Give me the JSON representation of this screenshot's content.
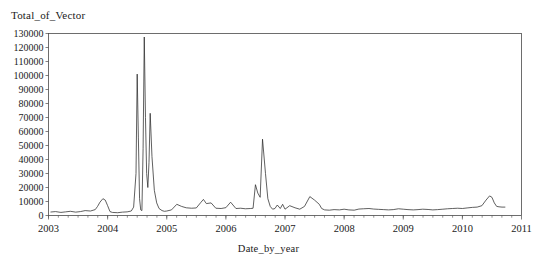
{
  "chart_data": {
    "type": "line",
    "title": "",
    "ylabel": "Total_of_Vector",
    "xlabel": "Date_by_year",
    "grid": false,
    "legend": null,
    "xlim": [
      2003.0,
      2011.0
    ],
    "ylim": [
      0,
      130000
    ],
    "x_tick_labels": [
      "2003",
      "2004",
      "2005",
      "2006",
      "2007",
      "2008",
      "2009",
      "2010",
      "2011"
    ],
    "x_tick_values": [
      2003,
      2004,
      2005,
      2006,
      2007,
      2008,
      2009,
      2010,
      2011
    ],
    "x_minor_tick_interval": 0.1667,
    "y_tick_labels": [
      "0",
      "10000",
      "20000",
      "30000",
      "40000",
      "50000",
      "60000",
      "70000",
      "80000",
      "90000",
      "100000",
      "110000",
      "120000",
      "130000"
    ],
    "y_tick_values": [
      0,
      10000,
      20000,
      30000,
      40000,
      50000,
      60000,
      70000,
      80000,
      90000,
      100000,
      110000,
      120000,
      130000
    ],
    "series": [
      {
        "name": "Total_of_Vector",
        "x": [
          2003.04,
          2003.12,
          2003.21,
          2003.29,
          2003.37,
          2003.46,
          2003.54,
          2003.62,
          2003.71,
          2003.79,
          2003.83,
          2003.87,
          2003.92,
          2003.96,
          2004.0,
          2004.04,
          2004.08,
          2004.17,
          2004.25,
          2004.33,
          2004.4,
          2004.44,
          2004.48,
          2004.5,
          2004.52,
          2004.54,
          2004.56,
          2004.58,
          2004.6,
          2004.62,
          2004.64,
          2004.66,
          2004.68,
          2004.7,
          2004.72,
          2004.75,
          2004.79,
          2004.83,
          2004.87,
          2004.92,
          2004.96,
          2005.0,
          2005.08,
          2005.17,
          2005.25,
          2005.33,
          2005.42,
          2005.5,
          2005.58,
          2005.62,
          2005.67,
          2005.75,
          2005.83,
          2005.92,
          2006.0,
          2006.08,
          2006.17,
          2006.25,
          2006.33,
          2006.42,
          2006.46,
          2006.5,
          2006.54,
          2006.58,
          2006.62,
          2006.67,
          2006.71,
          2006.75,
          2006.79,
          2006.83,
          2006.87,
          2006.92,
          2006.96,
          2007.0,
          2007.08,
          2007.17,
          2007.25,
          2007.33,
          2007.42,
          2007.5,
          2007.58,
          2007.62,
          2007.67,
          2007.75,
          2007.83,
          2007.92,
          2008.0,
          2008.08,
          2008.17,
          2008.25,
          2008.33,
          2008.42,
          2008.5,
          2008.58,
          2008.67,
          2008.75,
          2008.83,
          2008.92,
          2009.0,
          2009.08,
          2009.17,
          2009.25,
          2009.33,
          2009.42,
          2009.5,
          2009.58,
          2009.67,
          2009.75,
          2009.83,
          2009.92,
          2010.0,
          2010.08,
          2010.17,
          2010.25,
          2010.33,
          2010.4,
          2010.46,
          2010.5,
          2010.54,
          2010.58,
          2010.62,
          2010.67,
          2010.72
        ],
        "values": [
          2500,
          2800,
          2200,
          2600,
          3000,
          2400,
          2800,
          3500,
          3200,
          4200,
          6500,
          9500,
          12000,
          11000,
          7000,
          2800,
          2200,
          2000,
          2400,
          2600,
          3200,
          6000,
          30000,
          101000,
          56000,
          12000,
          4000,
          3500,
          48000,
          127500,
          70000,
          30000,
          20000,
          38000,
          73000,
          42000,
          18000,
          9000,
          5000,
          3500,
          3000,
          3200,
          4000,
          8000,
          6500,
          5500,
          5200,
          5400,
          9500,
          11500,
          8500,
          9000,
          5200,
          5000,
          5600,
          9500,
          5000,
          5200,
          4800,
          5000,
          5200,
          22000,
          16000,
          13000,
          54500,
          30000,
          12000,
          6500,
          4500,
          5000,
          7500,
          5000,
          8000,
          4500,
          7000,
          5500,
          4500,
          6500,
          13500,
          11000,
          8000,
          5000,
          4000,
          3800,
          4200,
          4000,
          4500,
          4000,
          3800,
          4600,
          4800,
          5000,
          4600,
          4400,
          4200,
          4000,
          4200,
          4800,
          4500,
          4200,
          4000,
          4200,
          4500,
          4300,
          4000,
          4200,
          4500,
          4800,
          5000,
          5200,
          5000,
          5400,
          5800,
          6000,
          7000,
          11000,
          14000,
          13000,
          9000,
          6500,
          6200,
          6000,
          6000
        ]
      }
    ]
  }
}
